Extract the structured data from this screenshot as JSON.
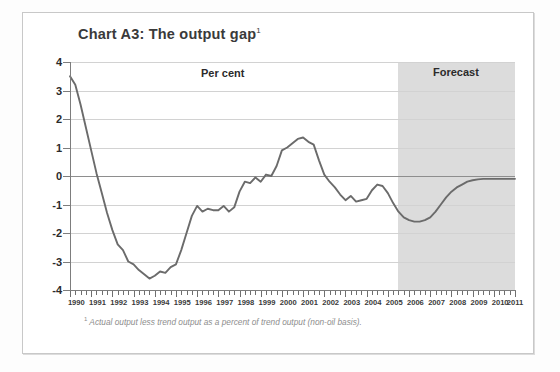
{
  "chart_data": {
    "type": "line",
    "title": "Chart A3: The output gap",
    "title_superscript": "1",
    "xlabel": "",
    "ylabel": "Per cent",
    "unit_label": "Per cent",
    "forecast_label": "Forecast",
    "footnote_superscript": "1",
    "footnote": "Actual output less trend output as a percent of trend output (non-oil basis).",
    "ylim": [
      -4,
      4
    ],
    "xlim": [
      1990,
      2011
    ],
    "ytick_labels": [
      "4",
      "3",
      "2",
      "1",
      "0",
      "-1",
      "-2",
      "-3",
      "-4"
    ],
    "ytick_values": [
      4,
      3,
      2,
      1,
      0,
      -1,
      -2,
      -3,
      -4
    ],
    "xtick_labels": [
      "1990",
      "1991",
      "1992",
      "1993",
      "1994",
      "1995",
      "1996",
      "1997",
      "1998",
      "1999",
      "2000",
      "2001",
      "2002",
      "2003",
      "2004",
      "2005",
      "2006",
      "2007",
      "2008",
      "2009",
      "2010",
      "2011"
    ],
    "xtick_values": [
      1990,
      1991,
      1992,
      1993,
      1994,
      1995,
      1996,
      1997,
      1998,
      1999,
      2000,
      2001,
      2002,
      2003,
      2004,
      2005,
      2006,
      2007,
      2008,
      2009,
      2010,
      2011
    ],
    "minor_ticks_per_year": 4,
    "grid": true,
    "legend": "none",
    "forecast_start": 2005.5,
    "forecast_end": 2011.0,
    "line_color": "#6b6b6b",
    "forecast_band_color": "#dcdcdc",
    "gridline_color": "#d2d2d2",
    "zero_line_color": "#8e8e8e",
    "series": [
      {
        "name": "Output gap",
        "x": [
          1990.0,
          1990.25,
          1990.5,
          1990.75,
          1991.0,
          1991.25,
          1991.5,
          1991.75,
          1992.0,
          1992.25,
          1992.5,
          1992.75,
          1993.0,
          1993.25,
          1993.5,
          1993.75,
          1994.0,
          1994.25,
          1994.5,
          1994.75,
          1995.0,
          1995.25,
          1995.5,
          1995.75,
          1996.0,
          1996.25,
          1996.5,
          1996.75,
          1997.0,
          1997.25,
          1997.5,
          1997.75,
          1998.0,
          1998.25,
          1998.5,
          1998.75,
          1999.0,
          1999.25,
          1999.5,
          1999.75,
          2000.0,
          2000.25,
          2000.5,
          2000.75,
          2001.0,
          2001.25,
          2001.5,
          2001.75,
          2002.0,
          2002.25,
          2002.5,
          2002.75,
          2003.0,
          2003.25,
          2003.5,
          2003.75,
          2004.0,
          2004.25,
          2004.5,
          2004.75,
          2005.0,
          2005.25,
          2005.5,
          2005.75,
          2006.0,
          2006.25,
          2006.5,
          2006.75,
          2007.0,
          2007.25,
          2007.5,
          2007.75,
          2008.0,
          2008.25,
          2008.5,
          2008.75,
          2009.0,
          2009.25,
          2009.5,
          2009.75,
          2010.0,
          2010.25,
          2010.5,
          2010.75,
          2011.0
        ],
        "y": [
          3.5,
          3.2,
          2.5,
          1.7,
          0.9,
          0.1,
          -0.6,
          -1.3,
          -1.9,
          -2.4,
          -2.6,
          -3.0,
          -3.1,
          -3.3,
          -3.45,
          -3.6,
          -3.5,
          -3.35,
          -3.4,
          -3.2,
          -3.1,
          -2.6,
          -2.0,
          -1.4,
          -1.05,
          -1.25,
          -1.15,
          -1.2,
          -1.2,
          -1.05,
          -1.25,
          -1.1,
          -0.55,
          -0.2,
          -0.25,
          -0.05,
          -0.2,
          0.05,
          0.0,
          0.35,
          0.9,
          1.0,
          1.15,
          1.3,
          1.35,
          1.2,
          1.1,
          0.55,
          0.05,
          -0.2,
          -0.4,
          -0.65,
          -0.85,
          -0.7,
          -0.9,
          -0.85,
          -0.8,
          -0.5,
          -0.3,
          -0.35,
          -0.6,
          -0.95,
          -1.25,
          -1.45,
          -1.55,
          -1.6,
          -1.6,
          -1.55,
          -1.45,
          -1.25,
          -1.0,
          -0.75,
          -0.55,
          -0.4,
          -0.3,
          -0.2,
          -0.15,
          -0.12,
          -0.1,
          -0.1,
          -0.1,
          -0.1,
          -0.1,
          -0.1,
          -0.1
        ]
      }
    ]
  },
  "chart": {
    "title": "Chart A3: The output gap",
    "title_sup": "1",
    "unit_label": "Per cent",
    "forecast_label": "Forecast",
    "footnote_sup": "1",
    "footnote": "Actual output less trend output as a percent of trend output (non-oil basis)."
  }
}
